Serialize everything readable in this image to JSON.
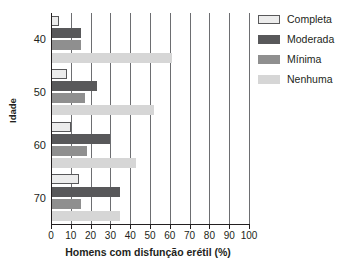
{
  "chart_data": {
    "type": "bar",
    "orientation": "horizontal",
    "title": "",
    "xlabel": "Homens com disfunção erétil (%)",
    "ylabel": "Idade",
    "categories": [
      "40",
      "50",
      "60",
      "70"
    ],
    "series": [
      {
        "name": "Completa",
        "color": "#ececec",
        "values": [
          4,
          8,
          10,
          14
        ]
      },
      {
        "name": "Moderada",
        "color": "#58585a",
        "values": [
          15,
          23,
          30,
          35
        ]
      },
      {
        "name": "Mínima",
        "color": "#8f8f8f",
        "values": [
          15,
          17,
          18,
          15
        ]
      },
      {
        "name": "Nenhuma",
        "color": "#d6d6d6",
        "values": [
          61,
          52,
          43,
          35
        ]
      }
    ],
    "xlim": [
      0,
      100
    ],
    "xticks": [
      0,
      10,
      20,
      30,
      40,
      50,
      60,
      70,
      80,
      90,
      100
    ],
    "xtick_labels": [
      "0",
      "10",
      "20",
      "30",
      "40",
      "50",
      "60",
      "70",
      "80",
      "90",
      "100"
    ],
    "ytick_labels": [
      "40",
      "50",
      "60",
      "70"
    ],
    "grid": true,
    "grid_axis": "x",
    "legend_position": "right"
  },
  "axes": {
    "x_title": "Homens com disfunção erétil (%)",
    "y_title": "Idade"
  },
  "legend": {
    "items": [
      {
        "label": "Completa"
      },
      {
        "label": "Moderada"
      },
      {
        "label": "Mínima"
      },
      {
        "label": "Nenhuma"
      }
    ]
  }
}
